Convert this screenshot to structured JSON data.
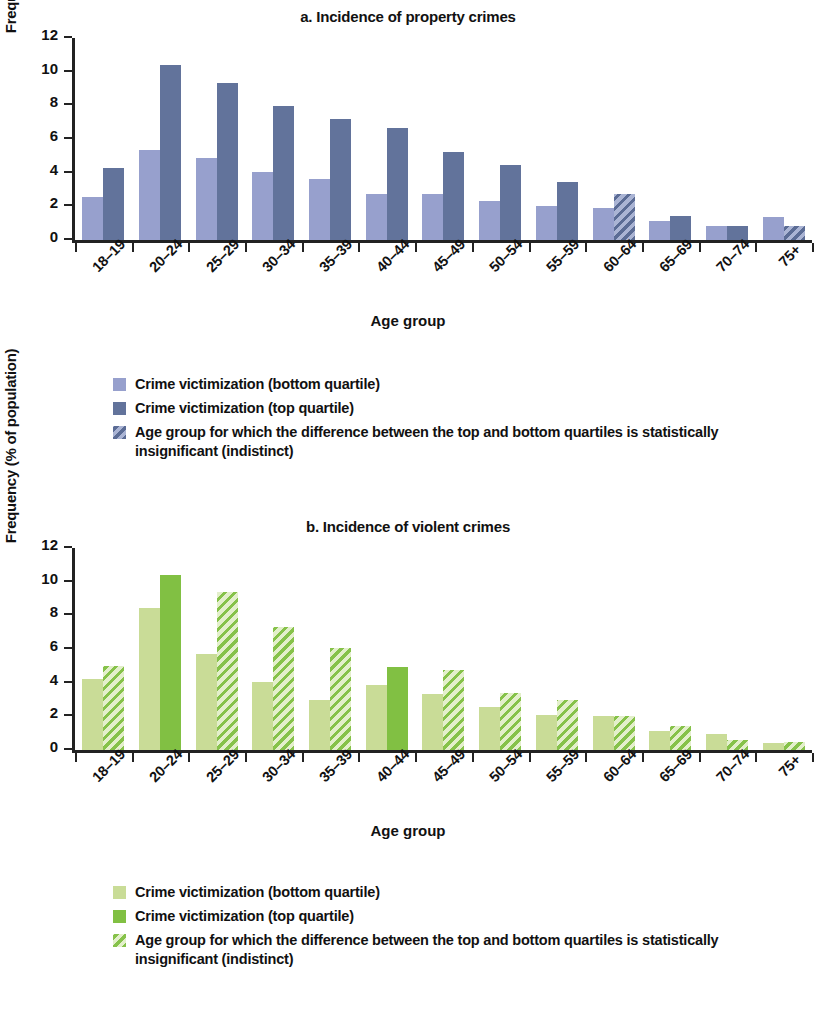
{
  "figure": {
    "panels": [
      {
        "id": "panel-a",
        "title": "a. Incidence of property crimes",
        "palette": {
          "light": "#97a0cd",
          "dark": "#62739b"
        }
      },
      {
        "id": "panel-b",
        "title": "b. Incidence of violent crimes",
        "palette": {
          "light": "#c9dc97",
          "dark": "#81c043"
        }
      }
    ],
    "legend_items": [
      "Crime victimization (bottom quartile)",
      "Crime victimization (top quartile)",
      "Age group for which the difference between the top and bottom quartiles is statistically insignificant (indistinct)"
    ],
    "axis_titles": {
      "x": "Age group",
      "y": "Frequency (% of population)"
    }
  },
  "chart_data": [
    {
      "type": "bar",
      "title": "a. Incidence of property crimes",
      "xlabel": "Age group",
      "ylabel": "Frequency (% of population)",
      "ylim": [
        0,
        12
      ],
      "yticks": [
        0,
        2,
        4,
        6,
        8,
        10,
        12
      ],
      "grid": false,
      "legend_position": "below",
      "categories": [
        "18–19",
        "20–24",
        "25–29",
        "30–34",
        "35–39",
        "40–44",
        "45–49",
        "50–54",
        "55–59",
        "60–64",
        "65–69",
        "70–74",
        "75+"
      ],
      "series": [
        {
          "name": "Crime victimization (bottom quartile)",
          "color": "#97a0cd",
          "values": [
            2.55,
            5.35,
            4.85,
            4.05,
            3.6,
            2.75,
            2.75,
            2.3,
            2.0,
            1.9,
            1.15,
            0.85,
            1.35
          ],
          "hatched": [
            false,
            false,
            false,
            false,
            false,
            false,
            false,
            false,
            false,
            false,
            false,
            false,
            false
          ]
        },
        {
          "name": "Crime victimization (top quartile)",
          "color": "#62739b",
          "values": [
            4.25,
            10.4,
            9.3,
            7.95,
            7.2,
            6.65,
            5.2,
            4.45,
            3.45,
            2.75,
            1.45,
            0.85,
            0.85
          ],
          "hatched": [
            false,
            false,
            false,
            false,
            false,
            false,
            false,
            false,
            false,
            true,
            false,
            false,
            true
          ]
        }
      ],
      "insignificant_groups": [
        "60–64",
        "70–74",
        "75+"
      ]
    },
    {
      "type": "bar",
      "title": "b. Incidence of violent crimes",
      "xlabel": "Age group",
      "ylabel": "Frequency (% of population)",
      "ylim": [
        0,
        12
      ],
      "yticks": [
        0,
        2,
        4,
        6,
        8,
        10,
        12
      ],
      "grid": false,
      "legend_position": "below",
      "categories": [
        "18–19",
        "20–24",
        "25–29",
        "30–34",
        "35–39",
        "40–44",
        "45–49",
        "50–54",
        "55–59",
        "60–64",
        "65–69",
        "70–74",
        "75+"
      ],
      "series": [
        {
          "name": "Crime victimization (bottom quartile)",
          "color": "#c9dc97",
          "values": [
            4.2,
            8.45,
            5.7,
            4.05,
            2.95,
            3.85,
            3.3,
            2.55,
            2.1,
            2.0,
            1.1,
            0.95,
            0.4
          ],
          "hatched": [
            false,
            false,
            false,
            false,
            false,
            false,
            false,
            false,
            false,
            false,
            false,
            false,
            false
          ]
        },
        {
          "name": "Crime victimization (top quartile)",
          "color": "#81c043",
          "values": [
            5.0,
            10.4,
            9.4,
            7.3,
            6.05,
            4.95,
            4.75,
            3.4,
            3.0,
            2.05,
            1.45,
            0.6,
            0.5
          ],
          "hatched": [
            true,
            false,
            true,
            true,
            true,
            false,
            true,
            true,
            true,
            true,
            true,
            true,
            true
          ]
        }
      ],
      "insignificant_groups": [
        "18–19",
        "25–29",
        "30–34",
        "35–39",
        "45–49",
        "50–54",
        "55–59",
        "60–64",
        "65–69",
        "70–74",
        "75+"
      ]
    }
  ]
}
